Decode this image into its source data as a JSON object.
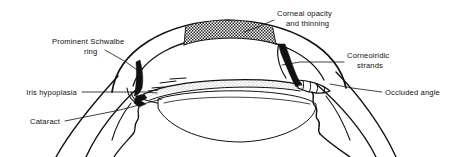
{
  "figure": {
    "kind": "anatomical-diagram",
    "background_color": "#ffffff",
    "ink_color": "#111111"
  },
  "annotations": [
    {
      "id": "corneal-opacity",
      "line1": "Corneal opacity",
      "line2": "and thinning",
      "align": "start",
      "text_x": 277,
      "text_y": 16,
      "line2_x": 286,
      "line2_y": 26,
      "leader": "M 274 20 L 258 27 L 244 32"
    },
    {
      "id": "prominent-schwalbe-ring",
      "line1": "Prominent Schwalbe",
      "line2": "ring",
      "align": "start",
      "text_x": 52,
      "text_y": 44,
      "line2_x": 84,
      "line2_y": 54,
      "leader": "M 105 50 L 126 62 L 140 72"
    },
    {
      "id": "corneoiridic-strands",
      "line1": "Corneoiridic",
      "line2": "strands",
      "align": "start",
      "text_x": 347,
      "text_y": 58,
      "line2_x": 357,
      "line2_y": 68,
      "leader": "M 344 62 L 300 62 L 280 64"
    },
    {
      "id": "iris-hypoplasia",
      "line1": "Iris hypoplasia",
      "line2": "",
      "align": "end",
      "text_x": 77,
      "text_y": 95,
      "line2_x": 0,
      "line2_y": 0,
      "leader": "M 82 92 L 145 92 L 157 93"
    },
    {
      "id": "occluded-angle",
      "line1": "Occluded angle",
      "line2": "",
      "align": "start",
      "text_x": 385,
      "text_y": 95,
      "line2_x": 0,
      "line2_y": 0,
      "leader": "M 382 92 L 352 88 L 330 84"
    },
    {
      "id": "cataract",
      "line1": "Cataract",
      "line2": "",
      "align": "end",
      "text_x": 60,
      "text_y": 124,
      "line2_x": 0,
      "line2_y": 0,
      "leader": "M 65 121 L 120 110 L 160 100"
    }
  ],
  "structures": [
    {
      "id": "cornea",
      "label": "cornea"
    },
    {
      "id": "sclera",
      "label": "sclera"
    },
    {
      "id": "anterior-chamber",
      "label": "anterior chamber"
    },
    {
      "id": "iris",
      "label": "hypoplastic iris"
    },
    {
      "id": "lens",
      "label": "cataractous lens"
    },
    {
      "id": "opacity-patch",
      "label": "corneal opacity hatching"
    },
    {
      "id": "schwalbe-ring",
      "label": "prominent Schwalbe ring"
    },
    {
      "id": "strand-band",
      "label": "corneoiridic strand band"
    },
    {
      "id": "angle-occlusion",
      "label": "occluded drainage angle"
    },
    {
      "id": "zonules-left",
      "label": "left zonular fibres"
    },
    {
      "id": "zonules-right",
      "label": "right zonular fibres"
    }
  ]
}
